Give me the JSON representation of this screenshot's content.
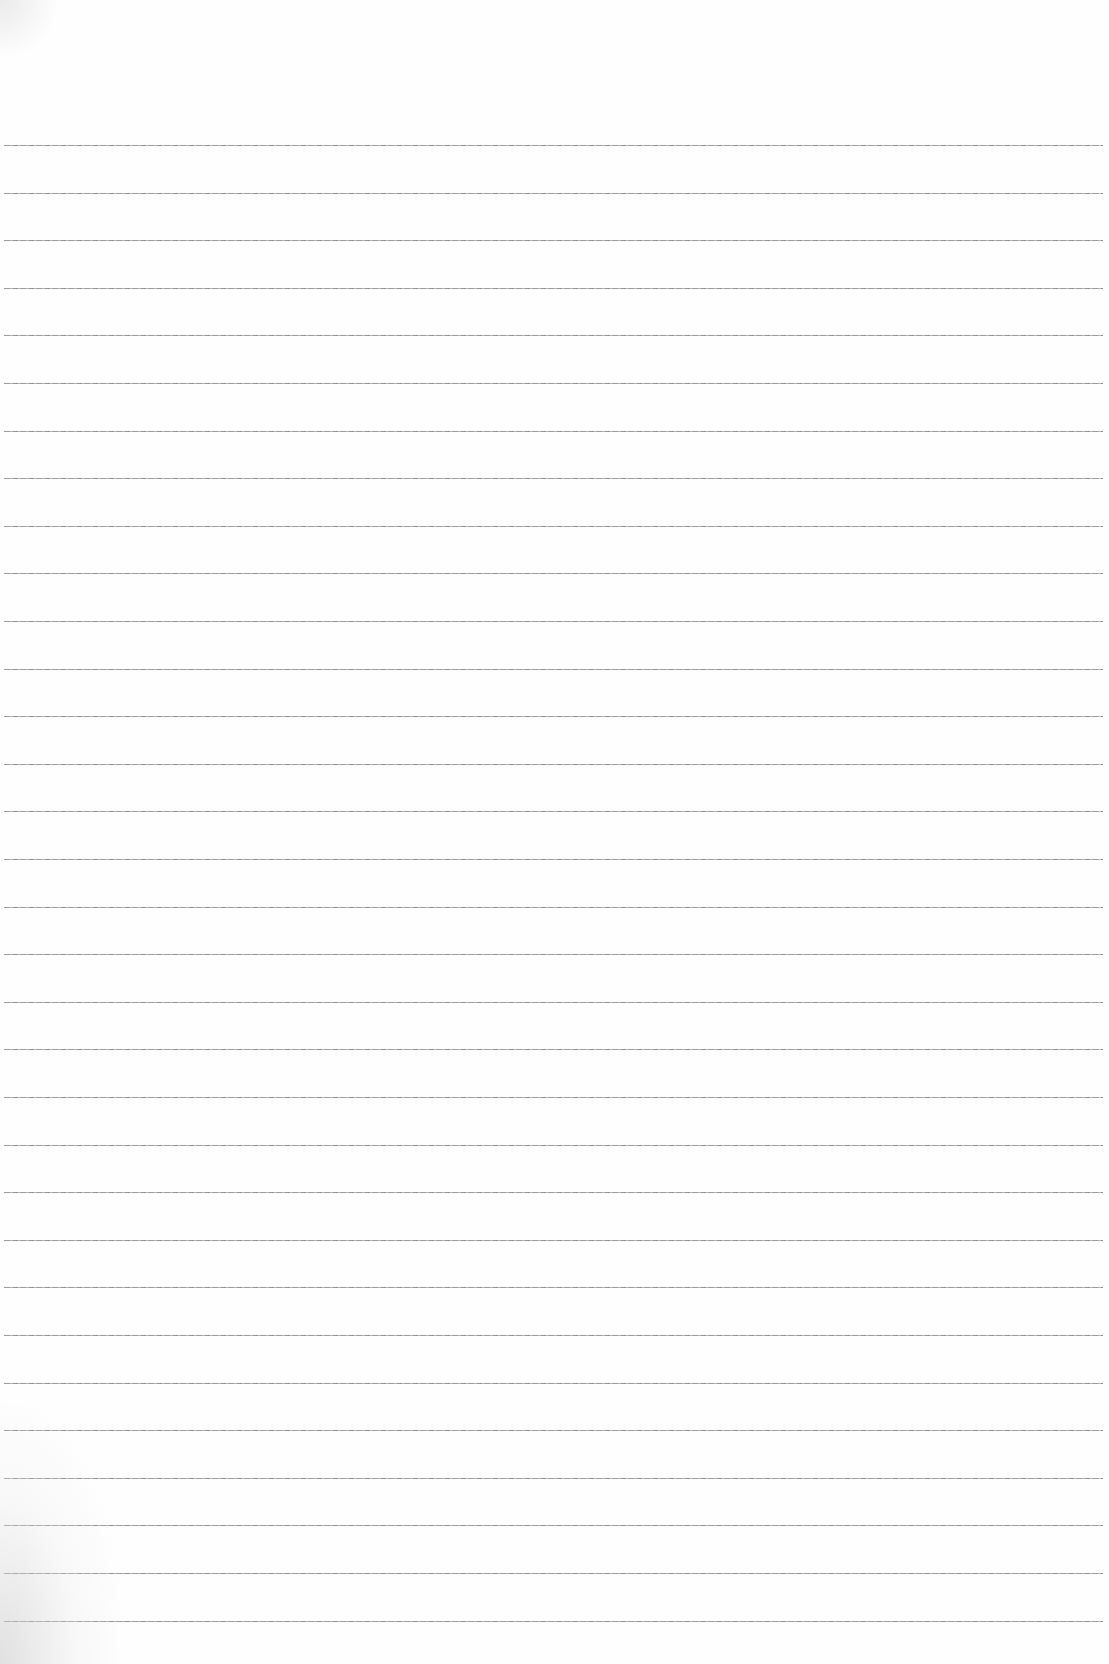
{
  "document": {
    "type": "lined-paper",
    "text": "",
    "rules": {
      "count": 32,
      "first_y": 145,
      "spacing": 47.6,
      "color": "#8a8a8a"
    },
    "background_color": "#fefefe"
  }
}
